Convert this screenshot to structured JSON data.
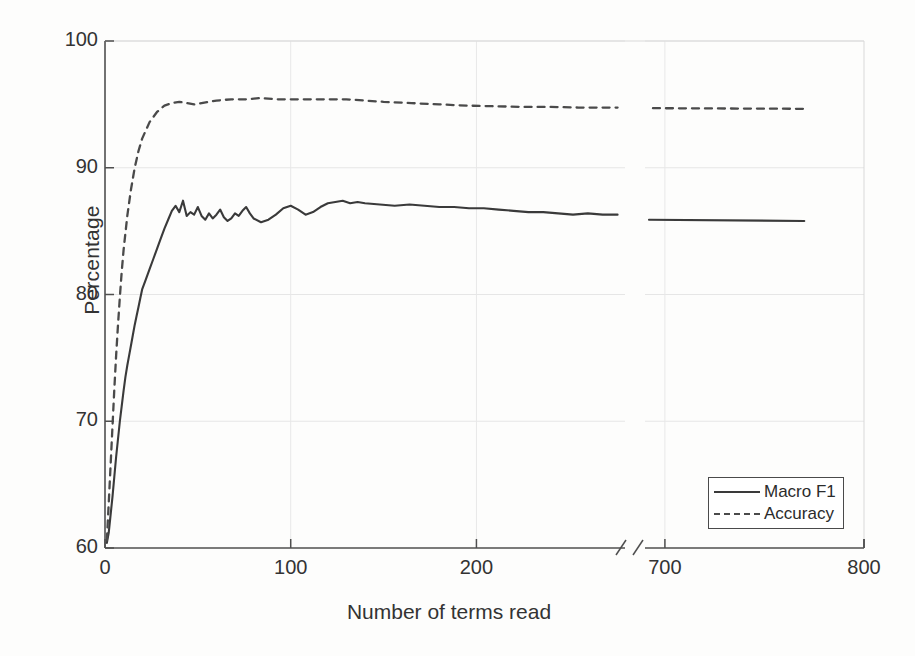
{
  "chart_data": {
    "type": "line",
    "title": "",
    "xlabel": "Number of terms read",
    "ylabel": "Percentage",
    "xlim": [
      0,
      800
    ],
    "ylim": [
      60,
      100
    ],
    "grid": true,
    "axis_break": {
      "present": true,
      "after": 280,
      "before": 690
    },
    "xticks": [
      {
        "value": 0,
        "label": "0"
      },
      {
        "value": 100,
        "label": "100"
      },
      {
        "value": 200,
        "label": "200"
      },
      {
        "value": 700,
        "label": "700"
      },
      {
        "value": 800,
        "label": "800"
      }
    ],
    "yticks": [
      {
        "value": 60,
        "label": "60"
      },
      {
        "value": 70,
        "label": "70"
      },
      {
        "value": 80,
        "label": "80"
      },
      {
        "value": 90,
        "label": "90"
      },
      {
        "value": 100,
        "label": "100"
      }
    ],
    "legend": {
      "position": "lower-right",
      "entries": [
        {
          "name": "Macro F1",
          "style": "solid"
        },
        {
          "name": "Accuracy",
          "style": "dashed"
        }
      ]
    },
    "series": [
      {
        "name": "Macro F1",
        "style": "solid",
        "color": "#3a3a3a",
        "x": [
          1,
          2,
          3,
          4,
          5,
          6,
          7,
          8,
          9,
          10,
          11,
          12,
          13,
          14,
          15,
          16,
          17,
          18,
          19,
          20,
          22,
          24,
          26,
          28,
          30,
          32,
          34,
          36,
          38,
          40,
          42,
          44,
          46,
          48,
          50,
          52,
          54,
          56,
          58,
          60,
          62,
          64,
          66,
          68,
          70,
          72,
          74,
          76,
          78,
          80,
          84,
          88,
          92,
          96,
          100,
          104,
          108,
          112,
          116,
          120,
          124,
          128,
          132,
          136,
          140,
          148,
          156,
          164,
          172,
          180,
          188,
          196,
          204,
          212,
          220,
          228,
          236,
          244,
          252,
          260,
          268,
          276
        ],
        "y": [
          60.4,
          61.2,
          62.6,
          64.0,
          65.6,
          67.2,
          68.6,
          70.0,
          71.2,
          72.4,
          73.5,
          74.4,
          75.2,
          76.0,
          76.8,
          77.6,
          78.3,
          79.0,
          79.7,
          80.4,
          81.2,
          82.0,
          82.8,
          83.6,
          84.4,
          85.2,
          85.9,
          86.6,
          87.0,
          86.5,
          87.4,
          86.2,
          86.5,
          86.3,
          86.9,
          86.2,
          85.9,
          86.4,
          86.0,
          86.3,
          86.7,
          86.1,
          85.8,
          86.0,
          86.4,
          86.2,
          86.6,
          86.9,
          86.4,
          86.0,
          85.7,
          85.9,
          86.3,
          86.8,
          87.0,
          86.7,
          86.3,
          86.5,
          86.9,
          87.2,
          87.3,
          87.4,
          87.2,
          87.3,
          87.2,
          87.1,
          87.0,
          87.1,
          87.0,
          86.9,
          86.9,
          86.8,
          86.8,
          86.7,
          86.6,
          86.5,
          86.5,
          86.4,
          86.3,
          86.4,
          86.3,
          86.3
        ]
      },
      {
        "name": "Macro F1 (tail)",
        "style": "solid",
        "color": "#3a3a3a",
        "x": [
          692,
          770
        ],
        "y": [
          85.9,
          85.8
        ]
      },
      {
        "name": "Accuracy",
        "style": "dashed",
        "color": "#4a4a4a",
        "x": [
          1,
          2,
          3,
          4,
          5,
          6,
          7,
          8,
          9,
          10,
          12,
          14,
          16,
          18,
          20,
          24,
          28,
          32,
          36,
          40,
          44,
          48,
          52,
          56,
          60,
          68,
          76,
          84,
          92,
          100,
          110,
          120,
          130,
          140,
          150,
          165,
          180,
          195,
          210,
          225,
          240,
          255,
          270,
          276
        ],
        "y": [
          60.6,
          63.5,
          66.5,
          69.5,
          72.5,
          75.2,
          77.6,
          79.8,
          81.8,
          83.5,
          86.2,
          88.3,
          90.0,
          91.3,
          92.3,
          93.6,
          94.4,
          94.9,
          95.1,
          95.2,
          95.1,
          95.0,
          95.1,
          95.2,
          95.3,
          95.4,
          95.4,
          95.5,
          95.4,
          95.4,
          95.4,
          95.4,
          95.4,
          95.3,
          95.2,
          95.1,
          95.0,
          94.9,
          94.85,
          94.8,
          94.8,
          94.75,
          94.75,
          94.75
        ]
      },
      {
        "name": "Accuracy (tail)",
        "style": "dashed",
        "color": "#4a4a4a",
        "x": [
          694,
          770
        ],
        "y": [
          94.7,
          94.65
        ]
      }
    ]
  }
}
